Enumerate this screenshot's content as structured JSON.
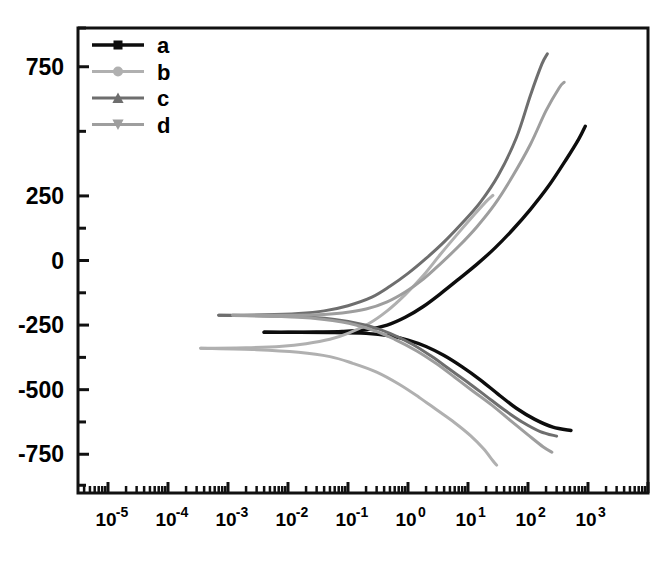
{
  "chart_data": {
    "type": "line",
    "title": "",
    "xlabel": "",
    "ylabel": "",
    "x_scale": "log",
    "y_scale": "linear",
    "xlim": [
      3.1623e-06,
      10000.0
    ],
    "ylim": [
      -900,
      900
    ],
    "grid": false,
    "legend_position": "top-left-inside",
    "x_tick_labels": [
      "10-5",
      "10-4",
      "10-3",
      "10-2",
      "10-1",
      "100",
      "101",
      "102",
      "103"
    ],
    "x_tick_mantissas": [
      "10",
      "10",
      "10",
      "10",
      "10",
      "10",
      "10",
      "10",
      "10"
    ],
    "x_tick_exponents": [
      "-5",
      "-4",
      "-3",
      "-2",
      "-1",
      "0",
      "1",
      "2",
      "3"
    ],
    "x_tick_values": [
      1e-05,
      0.0001,
      0.001,
      0.01,
      0.1,
      1,
      10,
      100,
      1000
    ],
    "y_tick_labels": [
      "750",
      "250",
      "0",
      "-250",
      "-500",
      "-750"
    ],
    "y_tick_values": [
      750,
      250,
      0,
      -250,
      -500,
      -750
    ],
    "y_minor_tick_values": [
      900,
      500,
      125,
      -125,
      -375,
      -625,
      -870
    ],
    "series": [
      {
        "name": "a",
        "label": "a",
        "color": "#0d0d0d",
        "marker": "square",
        "marker_size": 7,
        "branches": [
          {
            "branch": "upper",
            "points": [
              [
                0.004,
                -278
              ],
              [
                0.01,
                -278
              ],
              [
                0.03,
                -277
              ],
              [
                0.08,
                -275
              ],
              [
                0.2,
                -268
              ],
              [
                0.45,
                -250
              ],
              [
                0.9,
                -220
              ],
              [
                1.8,
                -178
              ],
              [
                3.5,
                -128
              ],
              [
                7,
                -72
              ],
              [
                14,
                -15
              ],
              [
                28,
                48
              ],
              [
                55,
                118
              ],
              [
                110,
                198
              ],
              [
                220,
                288
              ],
              [
                430,
                390
              ],
              [
                700,
                470
              ],
              [
                900,
                520
              ]
            ]
          },
          {
            "branch": "lower",
            "points": [
              [
                0.004,
                -278
              ],
              [
                0.05,
                -279
              ],
              [
                0.2,
                -282
              ],
              [
                0.5,
                -292
              ],
              [
                1.0,
                -308
              ],
              [
                2.0,
                -333
              ],
              [
                4.0,
                -368
              ],
              [
                8.0,
                -412
              ],
              [
                16,
                -462
              ],
              [
                32,
                -518
              ],
              [
                64,
                -572
              ],
              [
                130,
                -615
              ],
              [
                260,
                -645
              ],
              [
                520,
                -658
              ]
            ]
          }
        ]
      },
      {
        "name": "b",
        "label": "b",
        "color": "#b0b0b0",
        "marker": "circle",
        "marker_size": 8,
        "branches": [
          {
            "branch": "upper",
            "points": [
              [
                0.00035,
                -340
              ],
              [
                0.002,
                -338
              ],
              [
                0.008,
                -332
              ],
              [
                0.02,
                -322
              ],
              [
                0.05,
                -305
              ],
              [
                0.1,
                -282
              ],
              [
                0.22,
                -245
              ],
              [
                0.45,
                -195
              ],
              [
                0.9,
                -132
              ],
              [
                1.8,
                -58
              ],
              [
                3.5,
                25
              ],
              [
                7,
                108
              ],
              [
                13,
                180
              ],
              [
                20,
                228
              ],
              [
                26,
                252
              ]
            ]
          },
          {
            "branch": "lower",
            "points": [
              [
                0.00035,
                -340
              ],
              [
                0.003,
                -345
              ],
              [
                0.015,
                -355
              ],
              [
                0.05,
                -372
              ],
              [
                0.12,
                -398
              ],
              [
                0.3,
                -432
              ],
              [
                0.7,
                -478
              ],
              [
                1.5,
                -528
              ],
              [
                3,
                -578
              ],
              [
                6,
                -628
              ],
              [
                11,
                -678
              ],
              [
                18,
                -728
              ],
              [
                26,
                -775
              ],
              [
                30,
                -792
              ]
            ]
          }
        ]
      },
      {
        "name": "c",
        "label": "c",
        "color": "#6e6e6e",
        "marker": "triangle-up",
        "marker_size": 8,
        "branches": [
          {
            "branch": "upper",
            "points": [
              [
                0.0007,
                -212
              ],
              [
                0.004,
                -210
              ],
              [
                0.015,
                -205
              ],
              [
                0.04,
                -195
              ],
              [
                0.1,
                -175
              ],
              [
                0.25,
                -142
              ],
              [
                0.5,
                -100
              ],
              [
                1.0,
                -50
              ],
              [
                2.0,
                8
              ],
              [
                4.0,
                72
              ],
              [
                8,
                145
              ],
              [
                16,
                225
              ],
              [
                32,
                330
              ],
              [
                64,
                475
              ],
              [
                110,
                640
              ],
              [
                170,
                760
              ],
              [
                210,
                800
              ]
            ]
          },
          {
            "branch": "lower",
            "points": [
              [
                0.0007,
                -212
              ],
              [
                0.01,
                -216
              ],
              [
                0.06,
                -228
              ],
              [
                0.2,
                -250
              ],
              [
                0.5,
                -282
              ],
              [
                1.2,
                -325
              ],
              [
                2.5,
                -372
              ],
              [
                5,
                -422
              ],
              [
                10,
                -472
              ],
              [
                20,
                -525
              ],
              [
                40,
                -578
              ],
              [
                80,
                -625
              ],
              [
                160,
                -662
              ],
              [
                300,
                -680
              ]
            ]
          }
        ]
      },
      {
        "name": "d",
        "label": "d",
        "color": "#9e9e9e",
        "marker": "triangle-down",
        "marker_size": 8,
        "branches": [
          {
            "branch": "upper",
            "points": [
              [
                0.0012,
                -212
              ],
              [
                0.008,
                -212
              ],
              [
                0.03,
                -210
              ],
              [
                0.08,
                -203
              ],
              [
                0.2,
                -188
              ],
              [
                0.45,
                -160
              ],
              [
                0.9,
                -122
              ],
              [
                1.8,
                -72
              ],
              [
                3.5,
                -12
              ],
              [
                7,
                55
              ],
              [
                14,
                130
              ],
              [
                28,
                218
              ],
              [
                55,
                325
              ],
              [
                110,
                450
              ],
              [
                200,
                580
              ],
              [
                330,
                668
              ],
              [
                400,
                690
              ]
            ]
          },
          {
            "branch": "lower",
            "points": [
              [
                0.0012,
                -212
              ],
              [
                0.015,
                -220
              ],
              [
                0.08,
                -238
              ],
              [
                0.25,
                -268
              ],
              [
                0.6,
                -305
              ],
              [
                1.4,
                -350
              ],
              [
                3,
                -400
              ],
              [
                6,
                -452
              ],
              [
                12,
                -505
              ],
              [
                25,
                -560
              ],
              [
                50,
                -618
              ],
              [
                100,
                -675
              ],
              [
                180,
                -722
              ],
              [
                250,
                -742
              ]
            ]
          }
        ]
      }
    ]
  },
  "legend": {
    "items": [
      {
        "label": "a",
        "marker": "square",
        "color": "#0d0d0d"
      },
      {
        "label": "b",
        "marker": "circle",
        "color": "#b0b0b0"
      },
      {
        "label": "c",
        "marker": "triangle-up",
        "color": "#6e6e6e"
      },
      {
        "label": "d",
        "marker": "triangle-down",
        "color": "#9e9e9e"
      }
    ]
  },
  "axes": {
    "frame_color": "#111111",
    "frame_width": 3
  }
}
